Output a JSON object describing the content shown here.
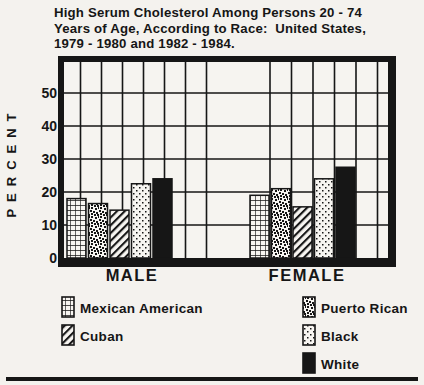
{
  "figure": {
    "title_lines": [
      "High Serum Cholesterol Among Persons 20 - 74",
      "Years of Age, According to Race:  United States,",
      "1979 - 1980 and 1982 - 1984."
    ]
  },
  "chart_data": {
    "type": "bar",
    "title": "High Serum Cholesterol Among Persons 20 - 74 Years of Age, According to Race: United States, 1979 - 1980 and 1982 - 1984.",
    "categories": [
      "MALE",
      "FEMALE"
    ],
    "series": [
      {
        "name": "Mexican American",
        "pattern": "grid",
        "values": [
          18.0,
          19.0
        ]
      },
      {
        "name": "Puerto Rican",
        "pattern": "speckle",
        "values": [
          16.5,
          21.0
        ]
      },
      {
        "name": "Cuban",
        "pattern": "diagonal",
        "values": [
          14.5,
          15.5
        ]
      },
      {
        "name": "Black",
        "pattern": "dots",
        "values": [
          22.5,
          24.0
        ]
      },
      {
        "name": "White",
        "pattern": "solid",
        "values": [
          24.0,
          27.5
        ]
      }
    ],
    "xlabel": "",
    "ylabel": "PERCENT",
    "yticks": [
      0,
      10,
      20,
      30,
      40,
      50
    ],
    "ylim": [
      0,
      59
    ],
    "grid": true,
    "legend_position": "bottom",
    "colors": {
      "ink": "#161616",
      "paper": "#f4f2ee"
    }
  },
  "legend": {
    "left_column": [
      "Mexican American",
      "Cuban"
    ],
    "right_column": [
      "Puerto Rican",
      "Black",
      "White"
    ]
  }
}
